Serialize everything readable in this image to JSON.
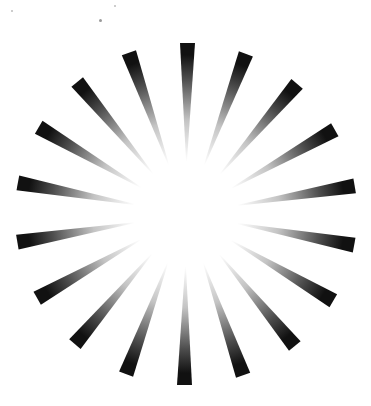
{
  "graphic": {
    "title": "",
    "description": "Halftone radial sunburst of tapered rays fading from black at the outer tip to white toward the center",
    "ray_count": 18,
    "ray_color": "#111111",
    "background_color": "#ffffff",
    "fade": "halftone dots, dark outside, light inside"
  },
  "specks": [
    {
      "name": "speck-1"
    },
    {
      "name": "speck-2"
    },
    {
      "name": "speck-3"
    }
  ]
}
